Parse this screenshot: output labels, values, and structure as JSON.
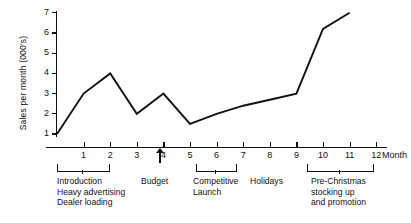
{
  "chart_data": {
    "type": "line",
    "title": "",
    "xlabel": "Month",
    "ylabel": "Sales per month (000's)",
    "x": [
      0,
      1,
      2,
      3,
      4,
      5,
      6,
      7,
      8,
      9,
      10,
      11
    ],
    "values": [
      1.0,
      3.0,
      4.0,
      2.0,
      3.0,
      1.5,
      2.0,
      2.4,
      2.7,
      3.0,
      6.2,
      7.0
    ],
    "series": [
      {
        "name": "Sales per month",
        "values": [
          1.0,
          3.0,
          4.0,
          2.0,
          3.0,
          1.5,
          2.0,
          2.4,
          2.7,
          3.0,
          6.2,
          7.0
        ]
      }
    ],
    "xlim": [
      0,
      12
    ],
    "ylim": [
      0,
      7
    ],
    "xticks": [
      1,
      2,
      3,
      4,
      5,
      6,
      7,
      8,
      9,
      10,
      11,
      12
    ],
    "yticks": [
      1,
      2,
      3,
      4,
      5,
      6,
      7
    ],
    "grid": false,
    "legend": false,
    "line_color": "#111111",
    "annotations": [
      {
        "name": "introduction",
        "span": [
          0,
          2
        ],
        "lines": [
          "Introduction",
          "Heavy advertising",
          "Dealer loading"
        ]
      },
      {
        "name": "budget",
        "at": 4.5,
        "lines": [
          "Budget"
        ],
        "marker": "up-arrow"
      },
      {
        "name": "competitive-launch",
        "span": [
          5.5,
          7
        ],
        "lines": [
          "Competitive",
          "Launch"
        ]
      },
      {
        "name": "holidays",
        "span": [
          8,
          9
        ],
        "lines": [
          "Holidays"
        ]
      },
      {
        "name": "pre-christmas",
        "span": [
          9.5,
          12
        ],
        "lines": [
          "Pre-Christmas",
          "stocking up",
          "and promotion"
        ]
      }
    ]
  },
  "axis": {
    "y_label": "Sales per month (000's)",
    "x_label": "Month",
    "y_ticks": [
      "1",
      "2",
      "3",
      "4",
      "5",
      "6",
      "7"
    ],
    "x_ticks": [
      "1",
      "2",
      "3",
      "4",
      "5",
      "6",
      "7",
      "8",
      "9",
      "10",
      "11",
      "12"
    ]
  },
  "annotations": {
    "introduction": {
      "line1": "Introduction",
      "line2": "Heavy advertising",
      "line3": "Dealer loading"
    },
    "budget": {
      "label": "Budget"
    },
    "competitive": {
      "line1": "Competitive",
      "line2": "Launch"
    },
    "holidays": {
      "label": "Holidays"
    },
    "prechristmas": {
      "line1": "Pre-Christmas",
      "line2": "stocking up",
      "line3": "and promotion"
    }
  }
}
